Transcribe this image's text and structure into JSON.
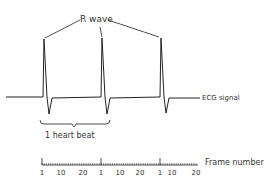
{
  "labels": {
    "r_wave": "R wave",
    "ecg_signal": "ECG signal",
    "heart_beat": "1 heart beat",
    "frame_number": "Frame number"
  },
  "timeline": {
    "tick_labels": [
      "1",
      "10",
      "20",
      "1",
      "10",
      "20",
      "1",
      "10",
      "20"
    ]
  },
  "colors": {
    "line": "#222222",
    "background": "#ffffff"
  }
}
